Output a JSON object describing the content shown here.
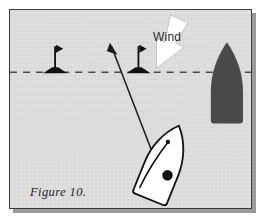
{
  "figure": {
    "caption": "Figure 10.",
    "background_color": "#dcdcdc",
    "border_color": "#3a3a3a",
    "shadow_color": "#9a9a9a"
  },
  "labels": {
    "wind": "Wind"
  },
  "scene": {
    "layline": {
      "name": "start-line",
      "style": "dashed",
      "color": "#4a4a4a",
      "y": 62,
      "x_start": 0,
      "x_end": 240
    },
    "wind_arrow": {
      "name": "wind-arrow",
      "color": "#ffffff",
      "outline_color": "#b8b8b8",
      "direction": "down-left",
      "tip_x": 148,
      "tip_y": 60
    },
    "marks": [
      {
        "name": "buoy-mark-left",
        "x": 45,
        "y": 62,
        "pole_height": 26,
        "color": "#111111"
      },
      {
        "name": "buoy-mark-right",
        "x": 128,
        "y": 62,
        "pole_height": 26,
        "color": "#111111"
      }
    ],
    "track_arrow": {
      "name": "boat-track-arrow",
      "color": "#1a1a1a",
      "from_x": 154,
      "from_y": 150,
      "to_x": 101,
      "to_y": 34
    },
    "white_boat": {
      "name": "white-boat",
      "fill": "#ffffff",
      "outline": "#111111",
      "heading_degrees": -22,
      "helm_dot": {
        "x": 166,
        "y": 160,
        "r": 5
      }
    },
    "dark_boat": {
      "name": "dark-boat",
      "fill": "#4a4a4a",
      "bow_x": 216,
      "bow_y": 32,
      "stern_y": 112
    }
  }
}
